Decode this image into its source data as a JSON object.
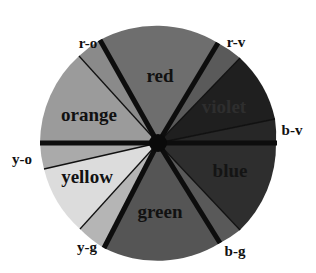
{
  "diagram": {
    "type": "color-wheel",
    "center": [
      158,
      143
    ],
    "radius": 118,
    "segments": [
      {
        "id": "red",
        "label": "red",
        "fill": "#6e6e6e",
        "label_pos": [
          160,
          82
        ],
        "label_color": "#111111",
        "label_size": 19
      },
      {
        "id": "r-v",
        "label": "r-v",
        "fill": "#5a5a5a"
      },
      {
        "id": "violet",
        "label": "violet",
        "fill": "#1e1e1e",
        "label_pos": [
          224,
          113
        ],
        "label_color": "#2c2c2c",
        "label_size": 19
      },
      {
        "id": "b-v",
        "label": "b-v",
        "fill": "#262626"
      },
      {
        "id": "blue",
        "label": "blue",
        "fill": "#2e2e2e",
        "label_pos": [
          230,
          177
        ],
        "label_color": "#141414",
        "label_size": 19
      },
      {
        "id": "b-g",
        "label": "b-g",
        "fill": "#575757"
      },
      {
        "id": "green",
        "label": "green",
        "fill": "#555555",
        "label_pos": [
          160,
          218
        ],
        "label_color": "#111111",
        "label_size": 19
      },
      {
        "id": "y-g",
        "label": "y-g",
        "fill": "#b5b5b5"
      },
      {
        "id": "yellow",
        "label": "yellow",
        "fill": "#dcdcdc",
        "label_pos": [
          87,
          183
        ],
        "label_color": "#111111",
        "label_size": 19
      },
      {
        "id": "y-o",
        "label": "y-o",
        "fill": "#a9a9a9"
      },
      {
        "id": "orange",
        "label": "orange",
        "fill": "#9b9b9b",
        "label_pos": [
          89,
          121
        ],
        "label_color": "#111111",
        "label_size": 19
      },
      {
        "id": "r-o",
        "label": "r-o",
        "fill": "#8a8a8a"
      }
    ],
    "outer_labels": [
      {
        "text": "r-o",
        "pos": [
          88,
          48
        ]
      },
      {
        "text": "r-v",
        "pos": [
          236,
          47
        ]
      },
      {
        "text": "b-v",
        "pos": [
          289,
          135
        ]
      },
      {
        "text": "y-o",
        "pos": [
          30,
          164
        ]
      },
      {
        "text": "y-g",
        "pos": [
          86,
          252
        ]
      },
      {
        "text": "b-g",
        "pos": [
          234,
          256
        ]
      }
    ]
  }
}
